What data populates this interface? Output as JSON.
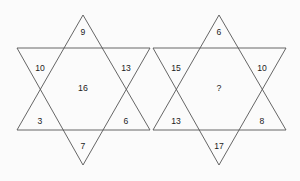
{
  "figure": {
    "type": "puzzle-figure",
    "background_color": "#fbfbfb",
    "line_color": "#555555",
    "text_color": "#1b1b1b"
  },
  "stars": [
    {
      "name": "left-star",
      "center_value": "16",
      "points": [
        {
          "position": "top",
          "value": "9",
          "x": 83,
          "y": 33
        },
        {
          "position": "upper-left",
          "value": "10",
          "x": 40,
          "y": 69
        },
        {
          "position": "upper-right",
          "value": "13",
          "x": 126,
          "y": 69
        },
        {
          "position": "lower-left",
          "value": "3",
          "x": 40,
          "y": 122
        },
        {
          "position": "lower-right",
          "value": "6",
          "x": 126,
          "y": 122
        },
        {
          "position": "bottom",
          "value": "7",
          "x": 83,
          "y": 147
        }
      ],
      "center": {
        "x": 83,
        "y": 89
      },
      "geometry": {
        "up_triangle": "83,15 150,130 17,130",
        "down_triangle": "17,48 150,48 83,165"
      }
    },
    {
      "name": "right-star",
      "center_value": "?",
      "points": [
        {
          "position": "top",
          "value": "6",
          "x": 219,
          "y": 33
        },
        {
          "position": "upper-left",
          "value": "15",
          "x": 176,
          "y": 69
        },
        {
          "position": "upper-right",
          "value": "10",
          "x": 262,
          "y": 69
        },
        {
          "position": "lower-left",
          "value": "13",
          "x": 176,
          "y": 122
        },
        {
          "position": "lower-right",
          "value": "8",
          "x": 262,
          "y": 122
        },
        {
          "position": "bottom",
          "value": "17",
          "x": 219,
          "y": 147
        }
      ],
      "center": {
        "x": 219,
        "y": 89
      },
      "geometry": {
        "up_triangle": "219,15 286,130 153,130",
        "down_triangle": "153,48 286,48 219,165"
      }
    }
  ]
}
